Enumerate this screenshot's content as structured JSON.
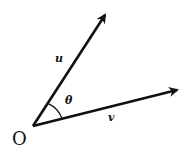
{
  "diagram": {
    "origin_label": "O",
    "vectors": [
      {
        "name": "u",
        "label": "u"
      },
      {
        "name": "v",
        "label": "v"
      }
    ],
    "angle_label": "θ",
    "stroke_color": "#111111",
    "background": "#ffffff"
  }
}
